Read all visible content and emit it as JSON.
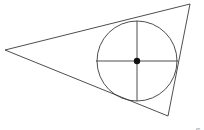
{
  "canvas": {
    "width": 204,
    "height": 130,
    "background_color": "#ffffff"
  },
  "credit": {
    "text": "Image: Gary Osborn",
    "color": "#8a8a8a"
  },
  "figure": {
    "stroke_color": "#3a3a3a",
    "stroke_width": 0.9,
    "center_dot_color": "#111111"
  },
  "chart_data": {
    "type": "diagram",
    "xlabel": "",
    "ylabel": "",
    "xlim": [
      0,
      204
    ],
    "ylim": [
      0,
      130
    ],
    "grid": false,
    "legend": "none",
    "shapes": [
      {
        "name": "triangle",
        "kind": "polygon",
        "points": [
          [
            5,
            50
          ],
          [
            190,
            4
          ],
          [
            168,
            116
          ]
        ],
        "stroke": "#3a3a3a",
        "fill": "none"
      },
      {
        "name": "inscribed-circle",
        "kind": "circle",
        "cx": 137,
        "cy": 61,
        "r": 40,
        "stroke": "#3a3a3a",
        "fill": "none"
      },
      {
        "name": "horizontal-diameter",
        "kind": "line",
        "points": [
          [
            96,
            61
          ],
          [
            178,
            61
          ]
        ],
        "stroke": "#3a3a3a"
      },
      {
        "name": "vertical-diameter",
        "kind": "line",
        "points": [
          [
            137,
            21
          ],
          [
            137,
            101
          ]
        ],
        "stroke": "#3a3a3a"
      },
      {
        "name": "center-point",
        "kind": "dot",
        "cx": 137,
        "cy": 61,
        "r": 3.2,
        "fill": "#111111"
      }
    ],
    "annotations": [
      {
        "name": "image-credit",
        "text": "Image: Gary Osborn",
        "x": 196,
        "y": 125,
        "rotation": -90,
        "color": "#8a8a8a"
      }
    ]
  }
}
